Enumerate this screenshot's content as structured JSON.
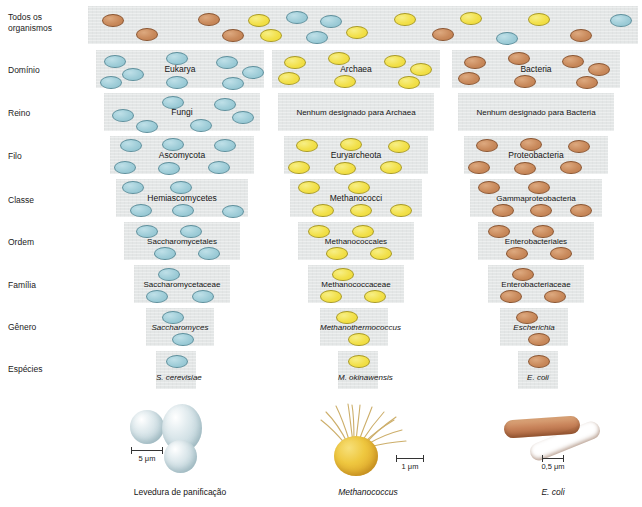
{
  "ranks": [
    {
      "id": "todos-os-organismos",
      "label": "Todos os\norganismos"
    },
    {
      "id": "dominio",
      "label": "Domínio"
    },
    {
      "id": "reino",
      "label": "Reino"
    },
    {
      "id": "filo",
      "label": "Filo"
    },
    {
      "id": "classe",
      "label": "Classe"
    },
    {
      "id": "ordem",
      "label": "Ordem"
    },
    {
      "id": "familia",
      "label": "Família"
    },
    {
      "id": "genero",
      "label": "Gênero"
    },
    {
      "id": "especies",
      "label": "Espécies"
    }
  ],
  "rank_labels": {
    "r0_line1": "Todos os",
    "r0_line2": "organismos",
    "r1": "Domínio",
    "r2": "Reino",
    "r3": "Filo",
    "r4": "Classe",
    "r5": "Ordem",
    "r6": "Família",
    "r7": "Gênero",
    "r8": "Espécies"
  },
  "columns": {
    "eukarya": {
      "dominio": "Eukarya",
      "reino": "Fungi",
      "filo": "Ascomycota",
      "classe": "Hemiascomycetes",
      "ordem": "Saccharomycetales",
      "familia": "Saccharomycetaceae",
      "genero": "Saccharomyces",
      "especies": "S. cerevisiae"
    },
    "archaea": {
      "dominio": "Archaea",
      "reino": "Nenhum designado para Archaea",
      "filo": "Euryarcheota",
      "classe": "Methanococci",
      "ordem": "Methanococcales",
      "familia": "Methanococcaceae",
      "genero": "Methanothermococcus",
      "especies": "M. okinawensis"
    },
    "bacteria": {
      "dominio": "Bacteria",
      "reino": "Nenhum designado para Bacteria",
      "filo": "Proteobacteria",
      "classe": "Gammaproteobacteria",
      "ordem": "Enterobacteriales",
      "familia": "Enterobacteriaceae",
      "genero": "Escherichia",
      "especies": "E. coli"
    }
  },
  "figures": [
    {
      "id": "yeast",
      "caption": "Levedura de panificação",
      "scale": "5 μm",
      "italic": false
    },
    {
      "id": "methanococcus",
      "caption": "Methanococcus",
      "scale": "1 μm",
      "italic": true
    },
    {
      "id": "ecoli",
      "caption": "E. coli",
      "scale": "0,5 μm",
      "italic": true
    }
  ],
  "colors": {
    "eukarya_oval": "#9fcdd8",
    "archaea_oval": "#f2e04a",
    "bacteria_oval": "#c98a5c",
    "band_bg": "#e3e6e6",
    "page_bg": "#ffffff"
  }
}
